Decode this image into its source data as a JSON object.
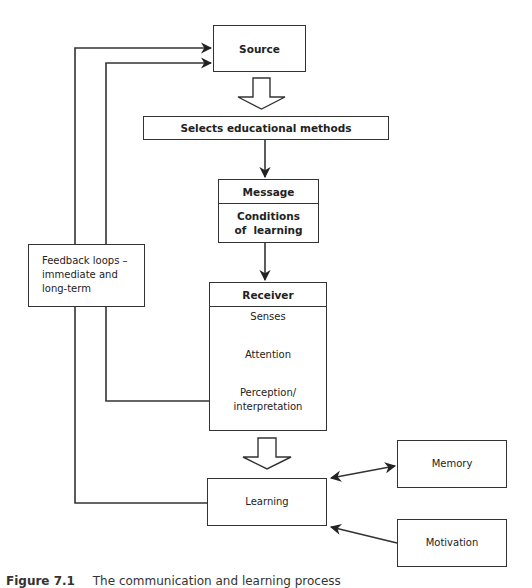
{
  "diagram": {
    "source": "Source",
    "selects": "Selects educational methods",
    "message": {
      "header": "Message",
      "body_line1": "Conditions",
      "body_line2": "of  learning"
    },
    "receiver": {
      "header": "Receiver",
      "steps": [
        "Senses",
        "Attention",
        "Perception/",
        "interpretation"
      ]
    },
    "feedback": {
      "line1": "Feedback loops –",
      "line2": "immediate and",
      "line3": "long-term"
    },
    "learning": "Learning",
    "memory": "Memory",
    "motivation": "Motivation"
  },
  "caption": {
    "figure": "Figure 7.1",
    "text": "The communication and learning process"
  },
  "colors": {
    "stroke": "#333333",
    "background": "#ffffff"
  }
}
